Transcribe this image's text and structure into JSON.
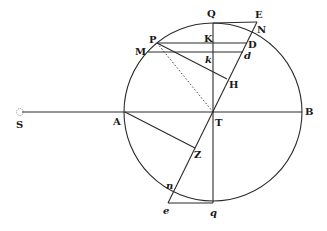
{
  "diagram": {
    "points": {
      "S": {
        "label": "S",
        "x": 20,
        "y": 112
      },
      "A": {
        "label": "A",
        "x": 125,
        "y": 112
      },
      "B": {
        "label": "B",
        "x": 302,
        "y": 112
      },
      "T": {
        "label": "T",
        "x": 213,
        "y": 112
      },
      "Q": {
        "label": "Q",
        "x": 213,
        "y": 23
      },
      "q": {
        "label": "q",
        "x": 213,
        "y": 203
      },
      "E": {
        "label": "E",
        "x": 257,
        "y": 22
      },
      "N": {
        "label": "N",
        "x": 254,
        "y": 28
      },
      "P": {
        "label": "P",
        "x": 157,
        "y": 43
      },
      "M": {
        "label": "M",
        "x": 148,
        "y": 52
      },
      "K": {
        "label": "K",
        "x": 213,
        "y": 43
      },
      "k": {
        "label": "k",
        "x": 213,
        "y": 52
      },
      "D": {
        "label": "D",
        "x": 247,
        "y": 43
      },
      "d": {
        "label": "d",
        "x": 243,
        "y": 52
      },
      "H": {
        "label": "H",
        "x": 227,
        "y": 79
      },
      "Z": {
        "label": "Z",
        "x": 195,
        "y": 148
      },
      "n": {
        "label": "n",
        "x": 175,
        "y": 188
      },
      "e": {
        "label": "e",
        "x": 168,
        "y": 203
      }
    },
    "circle": {
      "center": "T",
      "radius": 89
    },
    "colors": {
      "ink": "#2a2a2a",
      "background": "#ffffff"
    }
  }
}
